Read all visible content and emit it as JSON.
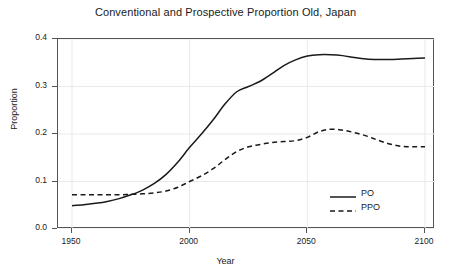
{
  "chart_data": {
    "type": "line",
    "title": "Conventional and Prospective Proportion Old, Japan",
    "xlabel": "Year",
    "ylabel": "Proportion",
    "xlim": [
      1950,
      2100
    ],
    "ylim": [
      0.0,
      0.4
    ],
    "xticks": [
      1950,
      2000,
      2050,
      2100
    ],
    "xtick_labels": [
      "1950",
      "2000",
      "2050",
      "2100"
    ],
    "yticks": [
      0.0,
      0.1,
      0.2,
      0.3,
      0.4
    ],
    "ytick_labels": [
      "0.0",
      "0.1",
      "0.2",
      "0.3",
      "0.4"
    ],
    "grid": true,
    "legend_position": "bottom-right",
    "line_color": "#1a1a1a",
    "grid_color": "#e9e9e9",
    "axis_color": "#545454",
    "background": "#ffffff",
    "x": [
      1950,
      1955,
      1960,
      1965,
      1970,
      1975,
      1980,
      1985,
      1990,
      1995,
      2000,
      2005,
      2010,
      2015,
      2020,
      2025,
      2030,
      2035,
      2040,
      2045,
      2050,
      2055,
      2060,
      2065,
      2070,
      2075,
      2080,
      2085,
      2090,
      2095,
      2100
    ],
    "series": [
      {
        "name": "PO",
        "style": "solid",
        "values": [
          0.049,
          0.051,
          0.054,
          0.058,
          0.064,
          0.072,
          0.082,
          0.096,
          0.115,
          0.141,
          0.172,
          0.2,
          0.23,
          0.263,
          0.289,
          0.3,
          0.311,
          0.327,
          0.344,
          0.356,
          0.364,
          0.367,
          0.367,
          0.365,
          0.361,
          0.358,
          0.357,
          0.357,
          0.358,
          0.359,
          0.36
        ]
      },
      {
        "name": "PPO",
        "style": "dashed",
        "values": [
          0.072,
          0.072,
          0.072,
          0.072,
          0.072,
          0.073,
          0.074,
          0.076,
          0.08,
          0.088,
          0.1,
          0.112,
          0.127,
          0.146,
          0.163,
          0.173,
          0.178,
          0.182,
          0.184,
          0.186,
          0.193,
          0.205,
          0.21,
          0.208,
          0.203,
          0.196,
          0.187,
          0.179,
          0.174,
          0.173,
          0.173
        ]
      }
    ],
    "legend": [
      {
        "label": "PO",
        "style": "solid"
      },
      {
        "label": "PPO",
        "style": "dashed"
      }
    ]
  }
}
